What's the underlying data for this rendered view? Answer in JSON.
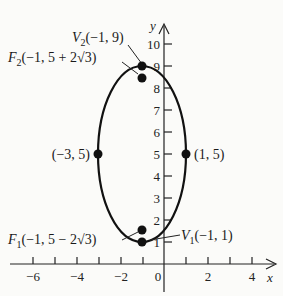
{
  "diagram": {
    "type": "ellipse-graph",
    "colors": {
      "ink": "#111111",
      "background": "#fbfbf9"
    },
    "axes": {
      "x_label": "x",
      "y_label": "y",
      "x_tick_labels": [
        "−6",
        "−4",
        "−2",
        "0",
        "2",
        "4"
      ],
      "y_tick_labels": [
        "1",
        "2",
        "3",
        "4",
        "5",
        "6",
        "7",
        "8",
        "9",
        "10"
      ],
      "x_range": [
        -6,
        4
      ],
      "y_range": [
        0,
        10
      ]
    },
    "ellipse": {
      "center": [
        -1,
        5
      ],
      "semi_major_vertical": 4,
      "semi_minor_horizontal": 2
    },
    "points": {
      "v2": {
        "coords": [
          -1,
          9
        ],
        "label_name": "V",
        "label_sub": "2",
        "label_rest": "(−1, 9)"
      },
      "f2": {
        "coords": [
          -1,
          8.464
        ],
        "label_name": "F",
        "label_sub": "2",
        "label_rest": "(−1, 5 + 2√3)"
      },
      "left": {
        "coords": [
          -3,
          5
        ],
        "label": "(−3, 5)"
      },
      "right": {
        "coords": [
          1,
          5
        ],
        "label": "(1, 5)"
      },
      "f1": {
        "coords": [
          -1,
          1.536
        ],
        "label_name": "F",
        "label_sub": "1",
        "label_rest": "(−1, 5 − 2√3)"
      },
      "v1": {
        "coords": [
          -1,
          1
        ],
        "label_name": "V",
        "label_sub": "1",
        "label_rest": "(−1, 1)"
      }
    }
  }
}
